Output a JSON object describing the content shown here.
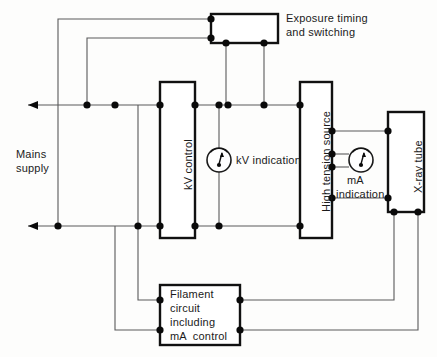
{
  "diagram": {
    "background_color": "#fdfdfc",
    "wire_color": "#5a5a5a",
    "box_color": "#111111",
    "node_color": "#0a0a0a"
  },
  "labels": {
    "mains_supply_line1": "Mains",
    "mains_supply_line2": "supply",
    "exposure_line1": "Exposure timing",
    "exposure_line2": "and switching",
    "kv_control": "kV control",
    "kv_indication": "kV indication",
    "high_tension_source": "High tension source",
    "ma_indication_line1": "mA",
    "ma_indication_line2": "indication",
    "xray_tube": "X-ray tube",
    "filament_line1": "Filament",
    "filament_line2": "circuit",
    "filament_line3": "including",
    "filament_line4": "mA  control"
  },
  "blocks": [
    {
      "name": "exposure-timing-and-switching",
      "x": 211,
      "y": 14,
      "w": 67,
      "h": 29,
      "orientation": "horizontal"
    },
    {
      "name": "kv-control",
      "x": 160,
      "y": 82,
      "w": 35,
      "h": 156,
      "orientation": "vertical"
    },
    {
      "name": "high-tension-source",
      "x": 300,
      "y": 82,
      "w": 32,
      "h": 156,
      "orientation": "vertical"
    },
    {
      "name": "x-ray-tube",
      "x": 388,
      "y": 112,
      "w": 36,
      "h": 100,
      "orientation": "vertical"
    },
    {
      "name": "filament-circuit-including-ma-control",
      "x": 160,
      "y": 285,
      "w": 80,
      "h": 60,
      "orientation": "horizontal"
    }
  ],
  "meters": [
    {
      "name": "kv-indication-meter",
      "cx": 219,
      "cy": 160,
      "r": 12
    },
    {
      "name": "ma-indication-meter",
      "cx": 361,
      "cy": 160,
      "r": 12
    }
  ],
  "buses": [
    {
      "name": "mains-live-bus",
      "y": 105,
      "x_from": 28,
      "x_to": 332,
      "arrow_at": "left"
    },
    {
      "name": "mains-neutral-bus",
      "y": 226,
      "x_from": 28,
      "x_to": 332,
      "arrow_at": "left"
    }
  ],
  "junction_nodes": [
    {
      "x": 87,
      "y": 105
    },
    {
      "x": 115,
      "y": 105
    },
    {
      "x": 160,
      "y": 105
    },
    {
      "x": 195,
      "y": 105
    },
    {
      "x": 219,
      "y": 105
    },
    {
      "x": 226,
      "y": 105
    },
    {
      "x": 264,
      "y": 105
    },
    {
      "x": 300,
      "y": 105
    },
    {
      "x": 58,
      "y": 226
    },
    {
      "x": 138,
      "y": 226
    },
    {
      "x": 160,
      "y": 226
    },
    {
      "x": 195,
      "y": 226
    },
    {
      "x": 219,
      "y": 226
    },
    {
      "x": 300,
      "y": 226
    },
    {
      "x": 211,
      "y": 19
    },
    {
      "x": 211,
      "y": 38
    },
    {
      "x": 226,
      "y": 43
    },
    {
      "x": 264,
      "y": 43
    },
    {
      "x": 332,
      "y": 131
    },
    {
      "x": 388,
      "y": 131
    },
    {
      "x": 332,
      "y": 154
    },
    {
      "x": 332,
      "y": 167
    },
    {
      "x": 332,
      "y": 198
    },
    {
      "x": 388,
      "y": 198
    },
    {
      "x": 394,
      "y": 212
    },
    {
      "x": 418,
      "y": 212
    },
    {
      "x": 160,
      "y": 300
    },
    {
      "x": 240,
      "y": 300
    },
    {
      "x": 160,
      "y": 330
    },
    {
      "x": 240,
      "y": 330
    }
  ]
}
